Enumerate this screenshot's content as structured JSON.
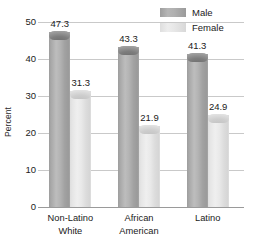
{
  "chart_data": {
    "type": "bar",
    "title": "",
    "xlabel": "",
    "ylabel": "Percent",
    "ylim": [
      0,
      50
    ],
    "yticks": [
      0,
      10,
      20,
      30,
      40,
      50
    ],
    "ytick_labels": [
      "0",
      "10",
      "20",
      "30",
      "40",
      "50"
    ],
    "grid": true,
    "legend_position": "top-right",
    "categories": [
      "Non-Latino White",
      "African American",
      "Latino"
    ],
    "category_lines": [
      [
        "Non-Latino",
        "White"
      ],
      [
        "African",
        "American"
      ],
      [
        "Latino"
      ]
    ],
    "series": [
      {
        "name": "Male",
        "color": "#a8a8a8",
        "values": [
          47.3,
          43.3,
          41.3
        ],
        "value_labels": [
          "47.3",
          "43.3",
          "41.3"
        ]
      },
      {
        "name": "Female",
        "color": "#e4e4e4",
        "values": [
          31.3,
          21.9,
          24.9
        ],
        "value_labels": [
          "31.3",
          "21.9",
          "24.9"
        ]
      }
    ]
  },
  "legend": {
    "items": [
      {
        "label": "Male",
        "swatch": "male"
      },
      {
        "label": "Female",
        "swatch": "female"
      }
    ]
  },
  "axis": {
    "y_title": "Percent"
  }
}
